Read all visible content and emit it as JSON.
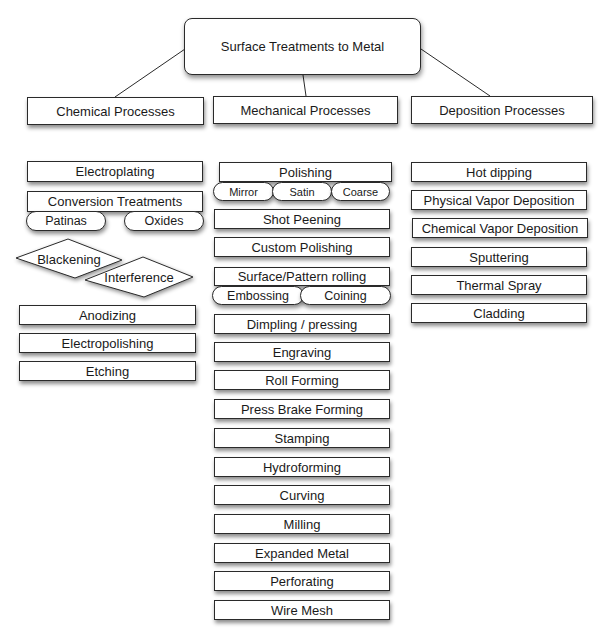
{
  "diagram": {
    "root": {
      "label": "Surface Treatments to Metal"
    },
    "categories": [
      {
        "label": "Chemical Processes"
      },
      {
        "label": "Mechanical Processes"
      },
      {
        "label": "Deposition Processes"
      }
    ],
    "chemical": {
      "items": [
        {
          "label": "Electroplating"
        },
        {
          "label": "Conversion Treatments",
          "sub": [
            {
              "label": "Patinas"
            },
            {
              "label": "Oxides"
            }
          ]
        },
        {
          "label": "Anodizing"
        },
        {
          "label": "Electropolishing"
        },
        {
          "label": "Etching"
        }
      ],
      "diamonds": [
        {
          "label": "Blackening"
        },
        {
          "label": "Interference"
        }
      ]
    },
    "mechanical": {
      "items": [
        {
          "label": "Polishing",
          "sub": [
            {
              "label": "Mirror"
            },
            {
              "label": "Satin"
            },
            {
              "label": "Coarse"
            }
          ]
        },
        {
          "label": "Shot Peening"
        },
        {
          "label": "Custom Polishing"
        },
        {
          "label": "Surface/Pattern rolling",
          "sub": [
            {
              "label": "Embossing"
            },
            {
              "label": "Coining"
            }
          ]
        },
        {
          "label": "Dimpling / pressing"
        },
        {
          "label": "Engraving"
        },
        {
          "label": "Roll Forming"
        },
        {
          "label": "Press Brake Forming"
        },
        {
          "label": "Stamping"
        },
        {
          "label": "Hydroforming"
        },
        {
          "label": "Curving"
        },
        {
          "label": "Milling"
        },
        {
          "label": "Expanded Metal"
        },
        {
          "label": "Perforating"
        },
        {
          "label": "Wire Mesh"
        }
      ]
    },
    "deposition": {
      "items": [
        {
          "label": "Hot dipping"
        },
        {
          "label": "Physical Vapor Deposition"
        },
        {
          "label": "Chemical Vapor Deposition"
        },
        {
          "label": "Sputtering"
        },
        {
          "label": "Thermal Spray"
        },
        {
          "label": "Cladding"
        }
      ]
    },
    "colors": {
      "border": "#2a2a2a",
      "background": "#ffffff",
      "text": "#1a1a1a"
    }
  }
}
